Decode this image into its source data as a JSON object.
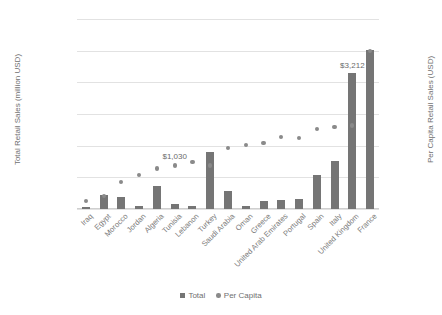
{
  "chart_data": {
    "type": "bar",
    "title": "",
    "xlabel": "",
    "ylabel": "Total Retail Sales (million USD)",
    "y2label": "Per Capita Retail Sales (USD)",
    "grid": true,
    "legend_position": "bottom",
    "ylim": [
      0,
      300000
    ],
    "y2lim": [
      0,
      4500
    ],
    "yticks": [
      "$-",
      "$50,000",
      "$100,000",
      "$150,000",
      "$200,000",
      "$250,000",
      "$300,000"
    ],
    "y2ticks": [
      "$-",
      "$500",
      "$1,000",
      "$1,500",
      "$2,000",
      "$2,500",
      "$3,000",
      "$3,500",
      "$4,000",
      "$4,500"
    ],
    "categories": [
      "Iraq",
      "Egypt",
      "Morocco",
      "Jordan",
      "Algeria",
      "Tunisia",
      "Lebanon",
      "Turkey",
      "Saudi Arabia",
      "Oman",
      "Greece",
      "United Arab Emirates",
      "Portugal",
      "Spain",
      "Italy",
      "United Kingdom",
      "France"
    ],
    "series": [
      {
        "name": "Total",
        "axis": "left",
        "type": "bar",
        "color": "#757575",
        "values": [
          3500,
          22000,
          19000,
          5000,
          37000,
          8000,
          4500,
          90000,
          29000,
          4000,
          13000,
          14000,
          16000,
          53000,
          76000,
          215000,
          251000
        ]
      },
      {
        "name": "Per Capita",
        "axis": "right",
        "type": "scatter",
        "color": "#8a8a8a",
        "values": [
          190,
          310,
          640,
          800,
          960,
          1030,
          1110,
          1030,
          1450,
          1520,
          1560,
          1700,
          1680,
          1900,
          1950,
          1980,
          3750
        ]
      }
    ],
    "data_labels": [
      {
        "category": "Tunisia",
        "series": "Per Capita",
        "text": "$1,030"
      },
      {
        "category": "United Kingdom",
        "series": "Total",
        "text": "$3,212"
      }
    ],
    "legend": [
      {
        "label": "Total",
        "marker": "square",
        "color": "#757575"
      },
      {
        "label": "Per Capita",
        "marker": "circle",
        "color": "#8a8a8a"
      }
    ]
  }
}
